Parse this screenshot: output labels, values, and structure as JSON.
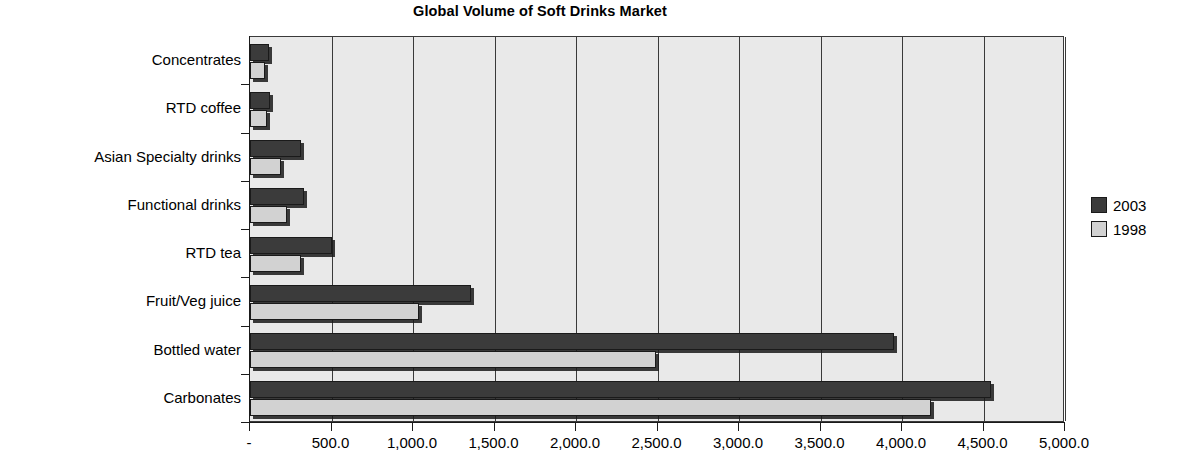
{
  "chart_data": {
    "type": "bar",
    "orientation": "horizontal",
    "title": "Global Volume of Soft Drinks Market",
    "xlabel": "",
    "ylabel": "",
    "categories": [
      "Concentrates",
      "RTD coffee",
      "Asian Specialty drinks",
      "Functional drinks",
      "RTD tea",
      "Fruit/Veg juice",
      "Bottled water",
      "Carbonates"
    ],
    "series": [
      {
        "name": "2003",
        "color": "#3b3b3b",
        "values": [
          117,
          125,
          310,
          330,
          500,
          1355,
          3950,
          4545
        ]
      },
      {
        "name": "1998",
        "color": "#d2d2d2",
        "values": [
          92,
          105,
          190,
          230,
          310,
          1035,
          2490,
          4180
        ]
      }
    ],
    "xlim": [
      0,
      5000
    ],
    "xticks": [
      0,
      500,
      1000,
      1500,
      2000,
      2500,
      3000,
      3500,
      4000,
      4500,
      5000
    ],
    "xticklabels": [
      "-",
      "500.0",
      "1,000.0",
      "1,500.0",
      "2,000.0",
      "2,500.0",
      "3,000.0",
      "3,500.0",
      "4,000.0",
      "4,500.0",
      "5,000.0"
    ],
    "grid": true,
    "grid_axis": "x",
    "legend_position": "right",
    "plot_background": "#e9e9e9",
    "axis_color": "#3a3a3a"
  },
  "legend": {
    "items": [
      {
        "label": "2003",
        "color": "#3b3b3b"
      },
      {
        "label": "1998",
        "color": "#d2d2d2"
      }
    ]
  }
}
